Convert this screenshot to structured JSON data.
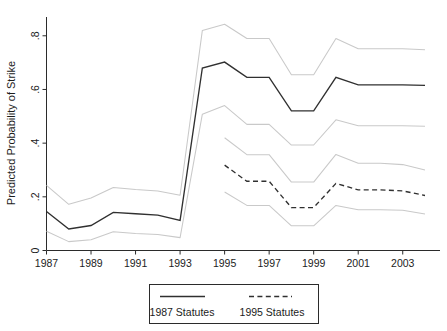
{
  "chart_data": {
    "type": "line",
    "title": "",
    "xlabel": "",
    "ylabel": "Predicted Probability of Strike",
    "xlim": [
      1987,
      2004
    ],
    "ylim": [
      0,
      0.87
    ],
    "grid": false,
    "x_tick_labels": [
      "1987",
      "1989",
      "1991",
      "1993",
      "1995",
      "1997",
      "1999",
      "2001",
      "2003"
    ],
    "x_tick_values": [
      1987,
      1989,
      1991,
      1993,
      1995,
      1997,
      1999,
      2001,
      2003
    ],
    "y_tick_labels": [
      "0",
      ".2",
      ".4",
      ".6",
      ".8"
    ],
    "y_tick_values": [
      0,
      0.2,
      0.4,
      0.6,
      0.8
    ],
    "legend_position": "below-center",
    "series": [
      {
        "name": "1987 Statutes",
        "style": "solid",
        "x": [
          1987,
          1988,
          1989,
          1990,
          1991,
          1992,
          1993,
          1994,
          1995,
          1996,
          1997,
          1998,
          1999,
          2000,
          2001,
          2002,
          2003,
          2004
        ],
        "values": [
          0.145,
          0.08,
          0.093,
          0.142,
          0.137,
          0.132,
          0.112,
          0.68,
          0.702,
          0.645,
          0.645,
          0.52,
          0.52,
          0.645,
          0.617,
          0.617,
          0.617,
          0.615
        ],
        "ci_upper": [
          0.243,
          0.172,
          0.196,
          0.235,
          0.227,
          0.222,
          0.206,
          0.82,
          0.843,
          0.79,
          0.79,
          0.655,
          0.655,
          0.79,
          0.752,
          0.752,
          0.752,
          0.748
        ],
        "ci_lower": [
          0.072,
          0.033,
          0.04,
          0.07,
          0.063,
          0.06,
          0.048,
          0.508,
          0.54,
          0.47,
          0.47,
          0.393,
          0.393,
          0.487,
          0.465,
          0.465,
          0.465,
          0.463
        ]
      },
      {
        "name": "1995 Statutes",
        "style": "dashed",
        "x": [
          1995,
          1996,
          1997,
          1998,
          1999,
          2000,
          2001,
          2002,
          2003,
          2004
        ],
        "values": [
          0.318,
          0.258,
          0.258,
          0.16,
          0.16,
          0.25,
          0.226,
          0.226,
          0.222,
          0.205
        ],
        "ci_upper": [
          0.42,
          0.357,
          0.357,
          0.255,
          0.255,
          0.358,
          0.325,
          0.325,
          0.32,
          0.3
        ],
        "ci_lower": [
          0.218,
          0.168,
          0.168,
          0.092,
          0.092,
          0.168,
          0.152,
          0.152,
          0.15,
          0.136
        ]
      }
    ],
    "confidence_band_note": "Each series is bracketed by upper and lower light-gray confidence interval lines."
  },
  "legend": {
    "entries": [
      {
        "label": "1987 Statutes",
        "style": "solid"
      },
      {
        "label": "1995 Statutes",
        "style": "dashed"
      }
    ]
  }
}
